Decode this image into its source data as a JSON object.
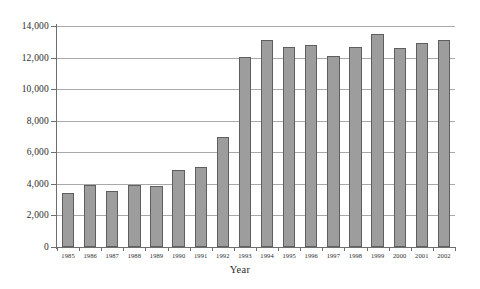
{
  "chart_data": {
    "type": "bar",
    "title": "",
    "xlabel": "Year",
    "ylabel": "",
    "ylim": [
      0,
      14000
    ],
    "ytick_step": 2000,
    "grid": true,
    "legend": "none",
    "bar_color": "#9d9d9d",
    "bar_border_color": "#5e5e5e",
    "gridline_color": "#a8a8a8",
    "axis_color": "#6e6e6e",
    "yticks": [
      "0",
      "2,000",
      "4,000",
      "6,000",
      "8,000",
      "10,000",
      "12,000",
      "14,000"
    ],
    "ytick_values": [
      0,
      2000,
      4000,
      6000,
      8000,
      10000,
      12000,
      14000
    ],
    "categories": [
      "1985",
      "1986",
      "1987",
      "1988",
      "1989",
      "1990",
      "1991",
      "1992",
      "1993",
      "1994",
      "1995",
      "1996",
      "1997",
      "1998",
      "1999",
      "2000",
      "2001",
      "2002"
    ],
    "values": [
      3400,
      3900,
      3550,
      3900,
      3850,
      4900,
      5100,
      7000,
      12050,
      13100,
      12700,
      12800,
      12100,
      12700,
      13500,
      12600,
      12900,
      13100
    ]
  }
}
